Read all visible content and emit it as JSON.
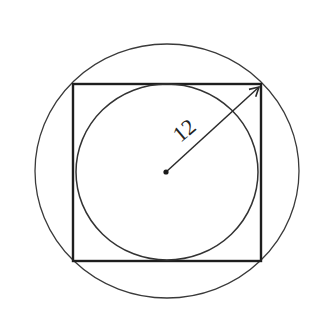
{
  "diagram": {
    "type": "geometry",
    "colors": {
      "background": "#ffffff",
      "stroke": "#2a2a2a",
      "square_stroke": "#1e1e1e"
    },
    "outer_circle": {
      "cx": 167,
      "cy": 171,
      "rx": 132,
      "ry": 127
    },
    "square": {
      "x": 73,
      "y": 84,
      "width": 188,
      "height": 177
    },
    "inner_circle": {
      "cx": 167,
      "cy": 172,
      "rx": 91,
      "ry": 88
    },
    "center_point": {
      "cx": 166,
      "cy": 172
    },
    "radius_arrow": {
      "from": [
        166,
        172
      ],
      "to": [
        259,
        87
      ]
    },
    "radius_label": {
      "text": "12",
      "x": 189,
      "y": 136,
      "rotation": -40
    }
  }
}
